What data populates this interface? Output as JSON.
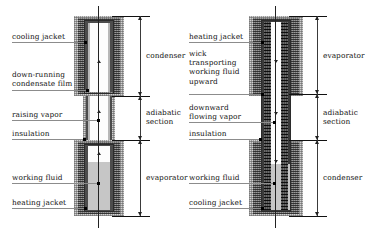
{
  "left_diagram": {
    "name": "two-phase closed thermosyphon",
    "labels_left": [
      {
        "id": "cooling-jacket",
        "text": "cooling jacket"
      },
      {
        "id": "condensate-film",
        "text": "down-running\ncondensate film"
      },
      {
        "id": "raising-vapor",
        "text": "raising vapor"
      },
      {
        "id": "insulation",
        "text": "insulation"
      },
      {
        "id": "working-fluid",
        "text": "working fluid"
      },
      {
        "id": "heating-jacket",
        "text": "heating jacket"
      }
    ],
    "labels_right": [
      {
        "id": "condenser",
        "text": "condenser"
      },
      {
        "id": "adiabatic-section",
        "text": "adiabatic\nsection"
      },
      {
        "id": "evaporator",
        "text": "evaporator"
      }
    ]
  },
  "right_diagram": {
    "name": "capillary wick heat pipe",
    "labels_left": [
      {
        "id": "heating-jacket",
        "text": "heating jacket"
      },
      {
        "id": "wick",
        "text": "wick\ntransporting\nworking fluid\nupward"
      },
      {
        "id": "downward-vapor",
        "text": "downward\nflowing vapor"
      },
      {
        "id": "insulation",
        "text": "insulation"
      },
      {
        "id": "working-fluid",
        "text": "working fluid"
      },
      {
        "id": "cooling-jacket",
        "text": "cooling jacket"
      }
    ],
    "labels_right": [
      {
        "id": "evaporator",
        "text": "evaporator"
      },
      {
        "id": "adiabatic-section",
        "text": "adiabatic\nsection"
      },
      {
        "id": "condenser",
        "text": "condenser"
      }
    ]
  },
  "colors": {
    "insulation": "#d3d3d3",
    "jacket": "#9a9a9a",
    "wall": "#4c4c4c",
    "wick": "#4a4a4a",
    "vapor": "#fdfdfd",
    "fluid": "#c6c6c6",
    "leader": "#8c8c8c",
    "ink": "#111111"
  }
}
